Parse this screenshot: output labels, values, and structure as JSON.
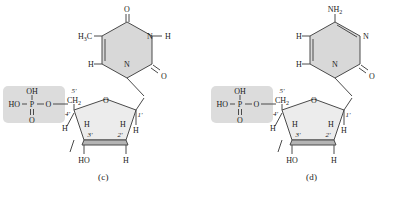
{
  "figure": {
    "background_color": "#ffffff",
    "line_color": "#4a4a4a",
    "text_color": "#1a1a1a",
    "ring_fill": "#d8d8d8",
    "sugar_fill": "#ececec",
    "phosphate_box_fill": "#dcdcdc",
    "sugar_front_edge_fill": "#b4b4b4"
  },
  "structures": [
    {
      "id": "c",
      "caption": "(c)",
      "base_name": "thymine",
      "phosphate": {
        "top_oh": "OH",
        "left_ho": "HO",
        "center_p": "P",
        "double_bond_o": "O",
        "link_o": "O"
      },
      "sugar": {
        "ch2_label": "CH",
        "ch2_sub": "2",
        "c5_prime": "5'",
        "c4_prime": "4'",
        "c3_prime": "3'",
        "c2_prime": "2'",
        "c1_prime": "1'",
        "ring_o": "O",
        "h_4prime": "H",
        "h_3prime": "H",
        "h_2prime": "H",
        "h_1prime": "H",
        "bottom_left_ho": "HO",
        "bottom_right_h": "H"
      },
      "base": {
        "methyl": "H",
        "methyl_sub": "3",
        "methyl_c": "C",
        "top_o": "O",
        "right_o": "O",
        "n1": "N",
        "n3": "N",
        "nh_h": "H",
        "ring_h": "H"
      }
    },
    {
      "id": "d",
      "caption": "(d)",
      "base_name": "cytosine",
      "phosphate": {
        "top_oh": "OH",
        "left_ho": "HO",
        "center_p": "P",
        "double_bond_o": "O",
        "link_o": "O"
      },
      "sugar": {
        "ch2_label": "CH",
        "ch2_sub": "2",
        "c5_prime": "5'",
        "c4_prime": "4'",
        "c3_prime": "3'",
        "c2_prime": "2'",
        "c1_prime": "1'",
        "ring_o": "O",
        "h_4prime": "H",
        "h_3prime": "H",
        "h_2prime": "H",
        "h_1prime": "H",
        "bottom_left_ho": "HO",
        "bottom_right_h": "H"
      },
      "base": {
        "amino": "NH",
        "amino_sub": "2",
        "right_o": "O",
        "n1": "N",
        "n3": "N",
        "ring_h_upper": "H",
        "ring_h_lower": "H"
      }
    }
  ]
}
